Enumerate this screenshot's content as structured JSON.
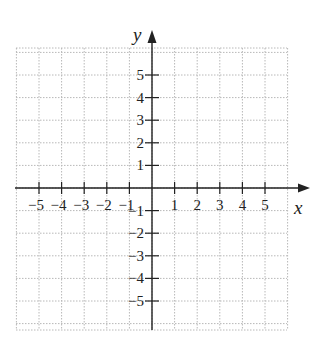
{
  "chart_data": {
    "type": "scatter",
    "title": "",
    "xlabel": "x",
    "ylabel": "y",
    "xlim": [
      -6,
      6
    ],
    "ylim": [
      -6,
      6
    ],
    "grid": true,
    "grid_style": "dotted",
    "x_ticks": [
      -5,
      -4,
      -3,
      -2,
      -1,
      1,
      2,
      3,
      4,
      5
    ],
    "y_ticks": [
      -5,
      -4,
      -3,
      -2,
      -1,
      1,
      2,
      3,
      4,
      5
    ],
    "x_tick_labels": [
      "−5",
      "−4",
      "−3",
      "−2",
      "−1",
      "1",
      "2",
      "3",
      "4",
      "5"
    ],
    "y_tick_labels": [
      "−5",
      "−4",
      "−3",
      "−2",
      "−1",
      "1",
      "2",
      "3",
      "4",
      "5"
    ],
    "series": [],
    "legend": null
  },
  "colors": {
    "axis": "#222222",
    "grid": "#b8b8b8",
    "background": "#ffffff"
  },
  "axes": {
    "x_label": "x",
    "y_label": "y"
  }
}
